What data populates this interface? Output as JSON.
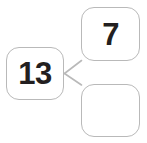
{
  "diagram": {
    "type": "number-bond",
    "theme": {
      "background": "#ffffff",
      "box_border_color": "#b9b9b9",
      "box_fill_color": "#ffffff",
      "connector_color": "#b9b9b9",
      "number_color": "#231f20"
    },
    "whole": {
      "label": "13",
      "aria": "whole-value-13",
      "filled": true
    },
    "parts": [
      {
        "label": "7",
        "aria": "part-value-7",
        "filled": true
      },
      {
        "label": "",
        "aria": "part-value-blank",
        "filled": false
      }
    ],
    "connectors": [
      {
        "from": "whole",
        "to": "part-1"
      },
      {
        "from": "whole",
        "to": "part-2"
      }
    ]
  }
}
